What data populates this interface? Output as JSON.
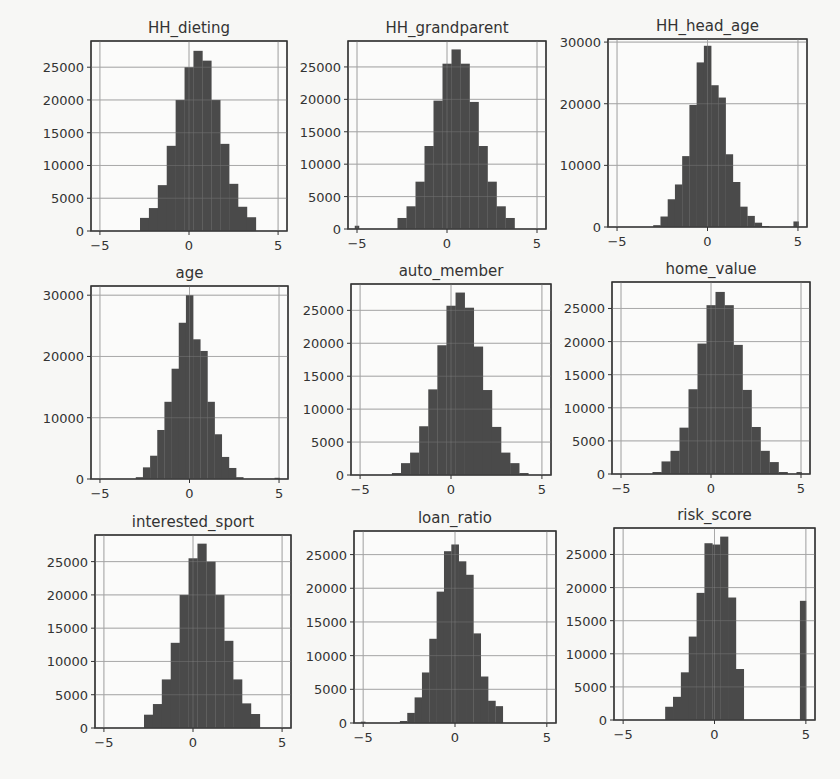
{
  "figure": {
    "type": "histogram-grid",
    "rows": 3,
    "cols": 3,
    "bar_color": "#4a4a4a",
    "grid_color": "#b0b0b0"
  },
  "chart_data": [
    {
      "type": "bar",
      "title": "HH_dieting",
      "xlim": [
        -5.5,
        5.5
      ],
      "xticks": [
        -5,
        0,
        5
      ],
      "xtick_labels": [
        "−5",
        "0",
        "5"
      ],
      "ylim": [
        0,
        29000
      ],
      "yticks": [
        0,
        5000,
        10000,
        15000,
        20000,
        25000
      ],
      "ytick_labels": [
        "0",
        "5000",
        "10000",
        "15000",
        "20000",
        "25000"
      ],
      "bin_edges_start": -2.75,
      "bin_width": 0.5,
      "values": [
        2000,
        3500,
        7000,
        13000,
        20000,
        25000,
        27500,
        26000,
        20000,
        13300,
        7200,
        3700,
        2100
      ],
      "outliers": [],
      "grid": true
    },
    {
      "type": "bar",
      "title": "HH_grandparent",
      "xlim": [
        -5.5,
        5.5
      ],
      "xticks": [
        -5,
        0,
        5
      ],
      "xtick_labels": [
        "−5",
        "0",
        "5"
      ],
      "ylim": [
        0,
        29000
      ],
      "yticks": [
        0,
        5000,
        10000,
        15000,
        20000,
        25000
      ],
      "ytick_labels": [
        "0",
        "5000",
        "10000",
        "15000",
        "20000",
        "25000"
      ],
      "bin_edges_start": -2.75,
      "bin_width": 0.5,
      "values": [
        1700,
        3500,
        7300,
        12800,
        19800,
        25500,
        27700,
        25500,
        19600,
        12800,
        7300,
        3500,
        1700
      ],
      "outliers": [
        {
          "x": -5.0,
          "width": 0.25,
          "value": 500
        }
      ],
      "grid": true
    },
    {
      "type": "bar",
      "title": "HH_head_age",
      "xlim": [
        -5.5,
        5.5
      ],
      "xticks": [
        -5,
        0,
        5
      ],
      "xtick_labels": [
        "−5",
        "0",
        "5"
      ],
      "ylim": [
        0,
        30500
      ],
      "yticks": [
        0,
        10000,
        20000,
        30000
      ],
      "ytick_labels": [
        "0",
        "10000",
        "20000",
        "30000"
      ],
      "bin_edges_start": -3.0,
      "bin_width": 0.4,
      "values": [
        300,
        1700,
        4500,
        6900,
        11500,
        19800,
        26700,
        29400,
        23000,
        21000,
        11800,
        7300,
        3300,
        1800,
        700,
        150
      ],
      "outliers": [
        {
          "x": 4.9,
          "width": 0.3,
          "value": 900
        }
      ],
      "grid": true
    },
    {
      "type": "bar",
      "title": "age",
      "xlim": [
        -5.5,
        5.5
      ],
      "xticks": [
        -5,
        0,
        5
      ],
      "xtick_labels": [
        "−5",
        "0",
        "5"
      ],
      "ylim": [
        0,
        31500
      ],
      "yticks": [
        0,
        10000,
        20000,
        30000
      ],
      "ytick_labels": [
        "0",
        "10000",
        "20000",
        "30000"
      ],
      "bin_edges_start": -3.0,
      "bin_width": 0.4,
      "values": [
        300,
        1900,
        3800,
        8000,
        12600,
        18000,
        25500,
        30000,
        22800,
        20900,
        12600,
        7300,
        3600,
        1800,
        300
      ],
      "outliers": [
        {
          "x": 4.9,
          "width": 0.3,
          "value": 200
        }
      ],
      "grid": true
    },
    {
      "type": "bar",
      "title": "auto_member",
      "xlim": [
        -5.5,
        5.5
      ],
      "xticks": [
        -5,
        0,
        5
      ],
      "xtick_labels": [
        "−5",
        "0",
        "5"
      ],
      "ylim": [
        0,
        29000
      ],
      "yticks": [
        0,
        5000,
        10000,
        15000,
        20000,
        25000
      ],
      "ytick_labels": [
        "0",
        "5000",
        "10000",
        "15000",
        "20000",
        "25000"
      ],
      "bin_edges_start": -3.25,
      "bin_width": 0.5,
      "values": [
        300,
        1800,
        3400,
        7400,
        13000,
        19700,
        25700,
        27700,
        25400,
        19500,
        12900,
        7300,
        3400,
        1800,
        300
      ],
      "outliers": [],
      "grid": true
    },
    {
      "type": "bar",
      "title": "home_value",
      "xlim": [
        -5.5,
        5.5
      ],
      "xticks": [
        -5,
        0,
        5
      ],
      "xtick_labels": [
        "−5",
        "0",
        "5"
      ],
      "ylim": [
        0,
        29000
      ],
      "yticks": [
        0,
        5000,
        10000,
        15000,
        20000,
        25000
      ],
      "ytick_labels": [
        "0",
        "5000",
        "10000",
        "15000",
        "20000",
        "25000"
      ],
      "bin_edges_start": -3.25,
      "bin_width": 0.5,
      "values": [
        300,
        1900,
        3500,
        7000,
        12800,
        19700,
        25500,
        27500,
        25500,
        19500,
        12700,
        7100,
        3500,
        1800,
        300
      ],
      "outliers": [
        {
          "x": 4.9,
          "width": 0.3,
          "value": 300
        }
      ],
      "grid": true
    },
    {
      "type": "bar",
      "title": "interested_sport",
      "xlim": [
        -5.5,
        5.5
      ],
      "xticks": [
        -5,
        0,
        5
      ],
      "xtick_labels": [
        "−5",
        "0",
        "5"
      ],
      "ylim": [
        0,
        29000
      ],
      "yticks": [
        0,
        5000,
        10000,
        15000,
        20000,
        25000
      ],
      "ytick_labels": [
        "0",
        "5000",
        "10000",
        "15000",
        "20000",
        "25000"
      ],
      "bin_edges_start": -2.75,
      "bin_width": 0.5,
      "values": [
        2000,
        3600,
        7300,
        12800,
        20000,
        25500,
        27700,
        25000,
        20000,
        13100,
        7300,
        3700,
        2100
      ],
      "outliers": [],
      "grid": true
    },
    {
      "type": "bar",
      "title": "loan_ratio",
      "xlim": [
        -5.5,
        5.5
      ],
      "xticks": [
        -5,
        0,
        5
      ],
      "xtick_labels": [
        "−5",
        "0",
        "5"
      ],
      "ylim": [
        0,
        28500
      ],
      "yticks": [
        0,
        5000,
        10000,
        15000,
        20000,
        25000
      ],
      "ytick_labels": [
        "0",
        "5000",
        "10000",
        "15000",
        "20000",
        "25000"
      ],
      "bin_edges_start": -3.0,
      "bin_width": 0.4,
      "values": [
        300,
        1500,
        3800,
        7500,
        12500,
        19500,
        25500,
        26500,
        24000,
        22000,
        13300,
        6900,
        3300,
        2500
      ],
      "outliers": [
        {
          "x": -5.0,
          "width": 0.25,
          "value": 200
        }
      ],
      "grid": true
    },
    {
      "type": "bar",
      "title": "risk_score",
      "xlim": [
        -5.5,
        5.5
      ],
      "xticks": [
        -5,
        0,
        5
      ],
      "xtick_labels": [
        "−5",
        "0",
        "5"
      ],
      "ylim": [
        0,
        29000
      ],
      "yticks": [
        0,
        5000,
        10000,
        15000,
        20000,
        25000
      ],
      "ytick_labels": [
        "0",
        "5000",
        "10000",
        "15000",
        "20000",
        "25000"
      ],
      "bin_edges_start": -2.7,
      "bin_width": 0.43,
      "values": [
        2000,
        3500,
        7200,
        12600,
        19200,
        26700,
        26500,
        27700,
        18500,
        7700
      ],
      "outliers": [
        {
          "x": 4.85,
          "width": 0.35,
          "value": 18000
        }
      ],
      "grid": true
    }
  ]
}
